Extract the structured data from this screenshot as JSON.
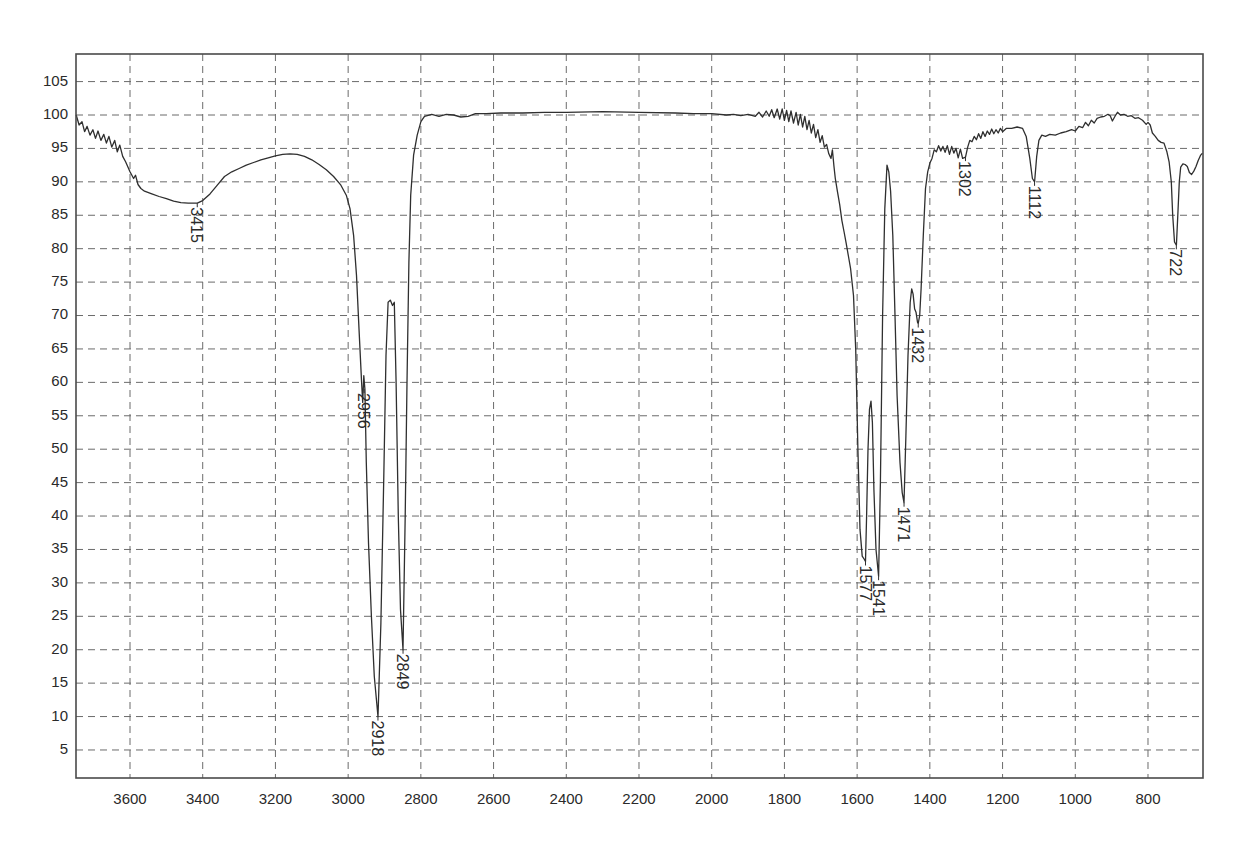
{
  "chart_data": {
    "type": "line",
    "title": "",
    "xlabel": "",
    "ylabel": "",
    "x_reversed": true,
    "xlim": [
      3750,
      650
    ],
    "ylim": [
      1,
      109
    ],
    "grid": true,
    "x_ticks": [
      3600,
      3400,
      3200,
      3000,
      2800,
      2600,
      2400,
      2200,
      2000,
      1800,
      1600,
      1400,
      1200,
      1000,
      800
    ],
    "y_ticks": [
      5,
      10,
      15,
      20,
      25,
      30,
      35,
      40,
      45,
      50,
      55,
      60,
      65,
      70,
      75,
      80,
      85,
      90,
      95,
      100,
      105
    ],
    "series": [
      {
        "name": "IR spectrum (transmittance)",
        "points": [
          [
            3748,
            100
          ],
          [
            3740,
            98.5
          ],
          [
            3732,
            99
          ],
          [
            3725,
            97.5
          ],
          [
            3718,
            98.3
          ],
          [
            3710,
            97
          ],
          [
            3702,
            97.8
          ],
          [
            3695,
            96.5
          ],
          [
            3688,
            97.6
          ],
          [
            3680,
            96.2
          ],
          [
            3672,
            97.1
          ],
          [
            3665,
            95.8
          ],
          [
            3658,
            96.8
          ],
          [
            3650,
            95.2
          ],
          [
            3642,
            96.2
          ],
          [
            3635,
            94.5
          ],
          [
            3628,
            95.5
          ],
          [
            3620,
            93.8
          ],
          [
            3612,
            93
          ],
          [
            3600,
            91.5
          ],
          [
            3590,
            90.5
          ],
          [
            3585,
            91
          ],
          [
            3578,
            89.6
          ],
          [
            3570,
            89
          ],
          [
            3560,
            88.6
          ],
          [
            3540,
            88.2
          ],
          [
            3520,
            87.8
          ],
          [
            3500,
            87.5
          ],
          [
            3480,
            87.1
          ],
          [
            3460,
            86.9
          ],
          [
            3440,
            86.8
          ],
          [
            3415,
            86.8
          ],
          [
            3400,
            87.2
          ],
          [
            3380,
            88.2
          ],
          [
            3360,
            89.5
          ],
          [
            3340,
            90.8
          ],
          [
            3320,
            91.5
          ],
          [
            3300,
            92
          ],
          [
            3280,
            92.5
          ],
          [
            3260,
            92.9
          ],
          [
            3240,
            93.3
          ],
          [
            3220,
            93.6
          ],
          [
            3200,
            93.9
          ],
          [
            3180,
            94.1
          ],
          [
            3160,
            94.2
          ],
          [
            3140,
            94.1
          ],
          [
            3120,
            93.8
          ],
          [
            3100,
            93.3
          ],
          [
            3080,
            92.6
          ],
          [
            3060,
            91.8
          ],
          [
            3040,
            90.8
          ],
          [
            3020,
            89.5
          ],
          [
            3005,
            88
          ],
          [
            2995,
            86
          ],
          [
            2985,
            82
          ],
          [
            2977,
            76
          ],
          [
            2970,
            68
          ],
          [
            2963,
            60
          ],
          [
            2960,
            57
          ],
          [
            2957,
            61
          ],
          [
            2954,
            59
          ],
          [
            2950,
            48
          ],
          [
            2944,
            36
          ],
          [
            2936,
            25
          ],
          [
            2928,
            16
          ],
          [
            2918,
            10
          ],
          [
            2910,
            24
          ],
          [
            2902,
            46
          ],
          [
            2896,
            64
          ],
          [
            2890,
            72
          ],
          [
            2884,
            72.3
          ],
          [
            2878,
            71.5
          ],
          [
            2873,
            72
          ],
          [
            2868,
            60
          ],
          [
            2862,
            40
          ],
          [
            2856,
            26
          ],
          [
            2849,
            20
          ],
          [
            2843,
            40
          ],
          [
            2838,
            60
          ],
          [
            2833,
            78
          ],
          [
            2828,
            88
          ],
          [
            2820,
            94
          ],
          [
            2810,
            97
          ],
          [
            2800,
            99
          ],
          [
            2790,
            99.8
          ],
          [
            2770,
            100.1
          ],
          [
            2750,
            99.8
          ],
          [
            2730,
            100.1
          ],
          [
            2710,
            100
          ],
          [
            2690,
            99.7
          ],
          [
            2670,
            99.8
          ],
          [
            2650,
            100.2
          ],
          [
            2620,
            100.2
          ],
          [
            2580,
            100.3
          ],
          [
            2520,
            100.3
          ],
          [
            2460,
            100.4
          ],
          [
            2400,
            100.4
          ],
          [
            2300,
            100.5
          ],
          [
            2200,
            100.4
          ],
          [
            2100,
            100.3
          ],
          [
            2050,
            100.2
          ],
          [
            2000,
            100.2
          ],
          [
            1960,
            100
          ],
          [
            1940,
            100.1
          ],
          [
            1920,
            99.9
          ],
          [
            1900,
            100.1
          ],
          [
            1880,
            99.8
          ],
          [
            1870,
            100.4
          ],
          [
            1860,
            99.7
          ],
          [
            1850,
            100.6
          ],
          [
            1842,
            99.8
          ],
          [
            1835,
            100.8
          ],
          [
            1828,
            99.6
          ],
          [
            1820,
            100.9
          ],
          [
            1813,
            99.4
          ],
          [
            1806,
            100.9
          ],
          [
            1800,
            99.2
          ],
          [
            1794,
            100.7
          ],
          [
            1788,
            99.0
          ],
          [
            1782,
            100.6
          ],
          [
            1775,
            98.8
          ],
          [
            1768,
            100.4
          ],
          [
            1762,
            98.5
          ],
          [
            1756,
            100.1
          ],
          [
            1750,
            98.2
          ],
          [
            1744,
            99.8
          ],
          [
            1738,
            97.8
          ],
          [
            1732,
            99.2
          ],
          [
            1726,
            97.3
          ],
          [
            1720,
            98.6
          ],
          [
            1714,
            96.6
          ],
          [
            1708,
            97.8
          ],
          [
            1702,
            95.9
          ],
          [
            1696,
            96.9
          ],
          [
            1690,
            95.2
          ],
          [
            1684,
            95.6
          ],
          [
            1678,
            94.2
          ],
          [
            1672,
            93.5
          ],
          [
            1668,
            94.8
          ],
          [
            1664,
            92.4
          ],
          [
            1660,
            90.5
          ],
          [
            1654,
            88.5
          ],
          [
            1648,
            86.6
          ],
          [
            1642,
            84.2
          ],
          [
            1636,
            82.5
          ],
          [
            1630,
            80.8
          ],
          [
            1624,
            78.9
          ],
          [
            1618,
            77
          ],
          [
            1610,
            73
          ],
          [
            1604,
            65
          ],
          [
            1598,
            50
          ],
          [
            1592,
            38
          ],
          [
            1586,
            34
          ],
          [
            1580,
            33.5
          ],
          [
            1577,
            33.2
          ],
          [
            1574,
            40
          ],
          [
            1570,
            50
          ],
          [
            1566,
            56
          ],
          [
            1562,
            57.2
          ],
          [
            1558,
            54
          ],
          [
            1554,
            44
          ],
          [
            1548,
            35
          ],
          [
            1541,
            31
          ],
          [
            1536,
            45
          ],
          [
            1530,
            70
          ],
          [
            1524,
            86
          ],
          [
            1518,
            92.5
          ],
          [
            1513,
            91.5
          ],
          [
            1508,
            88.6
          ],
          [
            1502,
            82
          ],
          [
            1496,
            70
          ],
          [
            1490,
            58
          ],
          [
            1482,
            48
          ],
          [
            1476,
            43.5
          ],
          [
            1471,
            42
          ],
          [
            1466,
            52
          ],
          [
            1460,
            64
          ],
          [
            1454,
            72
          ],
          [
            1450,
            74
          ],
          [
            1446,
            73.2
          ],
          [
            1442,
            71
          ],
          [
            1438,
            70.5
          ],
          [
            1434,
            69
          ],
          [
            1432,
            68.8
          ],
          [
            1428,
            70
          ],
          [
            1424,
            74
          ],
          [
            1418,
            82
          ],
          [
            1412,
            89
          ],
          [
            1406,
            91.5
          ],
          [
            1400,
            92.8
          ],
          [
            1394,
            93.5
          ],
          [
            1388,
            94.8
          ],
          [
            1382,
            94.5
          ],
          [
            1376,
            95.4
          ],
          [
            1370,
            94.6
          ],
          [
            1364,
            95.3
          ],
          [
            1358,
            94.4
          ],
          [
            1352,
            95.4
          ],
          [
            1346,
            94.1
          ],
          [
            1340,
            95.3
          ],
          [
            1334,
            94.3
          ],
          [
            1328,
            95
          ],
          [
            1322,
            93.6
          ],
          [
            1316,
            94.9
          ],
          [
            1310,
            93.5
          ],
          [
            1302,
            93.7
          ],
          [
            1296,
            95.2
          ],
          [
            1290,
            96.2
          ],
          [
            1284,
            96
          ],
          [
            1278,
            96.8
          ],
          [
            1272,
            96.3
          ],
          [
            1266,
            97.2
          ],
          [
            1260,
            96.5
          ],
          [
            1254,
            97.5
          ],
          [
            1248,
            96.8
          ],
          [
            1242,
            97.6
          ],
          [
            1236,
            97.1
          ],
          [
            1230,
            97.9
          ],
          [
            1224,
            97.2
          ],
          [
            1218,
            97.8
          ],
          [
            1212,
            97.3
          ],
          [
            1206,
            98
          ],
          [
            1200,
            97.5
          ],
          [
            1190,
            98
          ],
          [
            1175,
            98
          ],
          [
            1160,
            98.2
          ],
          [
            1145,
            98
          ],
          [
            1135,
            96.8
          ],
          [
            1125,
            93.5
          ],
          [
            1118,
            90.5
          ],
          [
            1112,
            90
          ],
          [
            1106,
            93.8
          ],
          [
            1100,
            96.2
          ],
          [
            1092,
            97
          ],
          [
            1082,
            96.8
          ],
          [
            1070,
            97.1
          ],
          [
            1055,
            97
          ],
          [
            1040,
            97.3
          ],
          [
            1025,
            97.5
          ],
          [
            1010,
            97.8
          ],
          [
            1000,
            97.6
          ],
          [
            990,
            98.3
          ],
          [
            980,
            98.1
          ],
          [
            972,
            98.9
          ],
          [
            964,
            98.4
          ],
          [
            956,
            99.2
          ],
          [
            948,
            98.8
          ],
          [
            940,
            99.5
          ],
          [
            930,
            99.7
          ],
          [
            920,
            99.8
          ],
          [
            910,
            100.1
          ],
          [
            904,
            99.9
          ],
          [
            898,
            99.1
          ],
          [
            890,
            99.9
          ],
          [
            884,
            100.4
          ],
          [
            876,
            100
          ],
          [
            866,
            100.1
          ],
          [
            856,
            99.8
          ],
          [
            846,
            99.9
          ],
          [
            836,
            99.5
          ],
          [
            826,
            99.6
          ],
          [
            815,
            99.2
          ],
          [
            805,
            98.6
          ],
          [
            800,
            98.9
          ],
          [
            794,
            98.5
          ],
          [
            788,
            97.3
          ],
          [
            780,
            96.8
          ],
          [
            772,
            96.2
          ],
          [
            764,
            95.9
          ],
          [
            756,
            95.8
          ],
          [
            748,
            94.5
          ],
          [
            742,
            93
          ],
          [
            736,
            90
          ],
          [
            732,
            85
          ],
          [
            727,
            81
          ],
          [
            722,
            80.5
          ],
          [
            718,
            85
          ],
          [
            714,
            90
          ],
          [
            710,
            92.2
          ],
          [
            704,
            92.7
          ],
          [
            698,
            92.6
          ],
          [
            692,
            92.3
          ],
          [
            686,
            91.4
          ],
          [
            680,
            91.1
          ],
          [
            674,
            91.6
          ],
          [
            668,
            92.3
          ],
          [
            662,
            93.2
          ],
          [
            655,
            94
          ],
          [
            650,
            94.3
          ]
        ]
      }
    ],
    "annotations": [
      {
        "text": "3415",
        "x": 3415,
        "y": 86.8
      },
      {
        "text": "2956",
        "x": 2956,
        "y": 59
      },
      {
        "text": "2918",
        "x": 2918,
        "y": 10
      },
      {
        "text": "2849",
        "x": 2849,
        "y": 20
      },
      {
        "text": "1577",
        "x": 1577,
        "y": 33.2
      },
      {
        "text": "1541",
        "x": 1541,
        "y": 31
      },
      {
        "text": "1471",
        "x": 1471,
        "y": 42
      },
      {
        "text": "1432",
        "x": 1432,
        "y": 68.8
      },
      {
        "text": "1302",
        "x": 1302,
        "y": 93.7
      },
      {
        "text": "1112",
        "x": 1112,
        "y": 90
      },
      {
        "text": "722",
        "x": 722,
        "y": 80.5
      }
    ]
  },
  "layout": {
    "frame": {
      "left": 76,
      "top": 54,
      "right": 1203,
      "bottom": 778
    },
    "x_map": {
      "ref_wavenumber": 3600,
      "ref_px": 130,
      "px_per_unit": 0.36357
    },
    "y_map": {
      "ref_value": 100,
      "ref_px": 115,
      "px_per_unit": 6.684
    }
  }
}
